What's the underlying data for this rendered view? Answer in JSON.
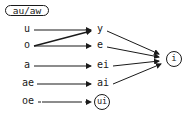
{
  "title": "au/aw",
  "sources": [
    {
      "label": "u",
      "y": 30
    },
    {
      "label": "o",
      "y": 46
    },
    {
      "label": "a",
      "y": 66
    },
    {
      "label": "ae",
      "y": 84
    },
    {
      "label": "oe",
      "y": 102
    }
  ],
  "targets": [
    {
      "label": "y",
      "y": 30
    },
    {
      "label": "e",
      "y": 46
    },
    {
      "label": "ei",
      "y": 66
    },
    {
      "label": "ai",
      "y": 84
    },
    {
      "label": "ui",
      "y": 102,
      "circled": true
    }
  ],
  "final": {
    "label": "i",
    "circled": true
  },
  "edges": [
    {
      "from": "u",
      "to": "y"
    },
    {
      "from": "o",
      "to": "y"
    },
    {
      "from": "o",
      "to": "e"
    },
    {
      "from": "a",
      "to": "ei"
    },
    {
      "from": "ae",
      "to": "ai"
    },
    {
      "from": "oe",
      "to": "ui"
    },
    {
      "from": "y",
      "to": "i"
    },
    {
      "from": "e",
      "to": "i"
    },
    {
      "from": "ei",
      "to": "i"
    },
    {
      "from": "ai",
      "to": "i"
    }
  ],
  "colors": {
    "ink": "#1a1a1a",
    "background": "#ffffff"
  }
}
